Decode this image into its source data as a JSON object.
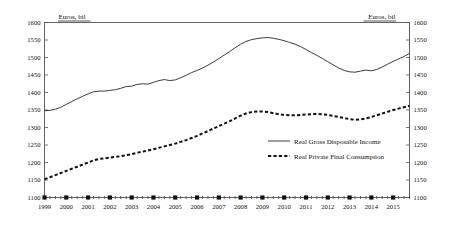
{
  "chart_data": {
    "type": "line",
    "title": "",
    "subtitle": "",
    "unit_label_left": "Euros, bil",
    "unit_label_right": "Euros, bil",
    "xlabel": "",
    "ylabel": "",
    "ylim": [
      1100,
      1600
    ],
    "ytick_step": 50,
    "yticks": [
      1100,
      1150,
      1200,
      1250,
      1300,
      1350,
      1400,
      1450,
      1500,
      1550,
      1600
    ],
    "ytick_labels": [
      "1100",
      "1150",
      "1200",
      "1250",
      "1300",
      "1350",
      "1400",
      "1450",
      "1500",
      "1550",
      "1600"
    ],
    "xlim": [
      1999.0,
      2015.75
    ],
    "xtick_labels": [
      "1999",
      "2000",
      "2001",
      "2002",
      "2003",
      "2004",
      "2005",
      "2006",
      "2007",
      "2008",
      "2009",
      "2010",
      "2011",
      "2012",
      "2013",
      "2014",
      "2015"
    ],
    "x_minor_per_year": 4,
    "grid": false,
    "legend_position": "center-right",
    "axes": {
      "left": true,
      "right": true,
      "top": true,
      "bottom": true
    },
    "x": [
      1999.0,
      1999.25,
      1999.5,
      1999.75,
      2000.0,
      2000.25,
      2000.5,
      2000.75,
      2001.0,
      2001.25,
      2001.5,
      2001.75,
      2002.0,
      2002.25,
      2002.5,
      2002.75,
      2003.0,
      2003.25,
      2003.5,
      2003.75,
      2004.0,
      2004.25,
      2004.5,
      2004.75,
      2005.0,
      2005.25,
      2005.5,
      2005.75,
      2006.0,
      2006.25,
      2006.5,
      2006.75,
      2007.0,
      2007.25,
      2007.5,
      2007.75,
      2008.0,
      2008.25,
      2008.5,
      2008.75,
      2009.0,
      2009.25,
      2009.5,
      2009.75,
      2010.0,
      2010.25,
      2010.5,
      2010.75,
      2011.0,
      2011.25,
      2011.5,
      2011.75,
      2012.0,
      2012.25,
      2012.5,
      2012.75,
      2013.0,
      2013.25,
      2013.5,
      2013.75,
      2014.0,
      2014.25,
      2014.5,
      2014.75,
      2015.0,
      2015.25,
      2015.5,
      2015.75
    ],
    "series": [
      {
        "name": "Real Gross Disposable Income",
        "style": "solid",
        "color": "#333333",
        "values": [
          1348,
          1349,
          1352,
          1358,
          1366,
          1374,
          1382,
          1389,
          1396,
          1402,
          1404,
          1404,
          1406,
          1408,
          1412,
          1417,
          1418,
          1423,
          1425,
          1424,
          1429,
          1434,
          1437,
          1434,
          1436,
          1442,
          1449,
          1457,
          1463,
          1470,
          1478,
          1487,
          1497,
          1507,
          1517,
          1528,
          1538,
          1546,
          1551,
          1554,
          1556,
          1557,
          1555,
          1552,
          1548,
          1543,
          1538,
          1531,
          1523,
          1514,
          1506,
          1497,
          1488,
          1479,
          1470,
          1463,
          1459,
          1458,
          1461,
          1464,
          1462,
          1466,
          1473,
          1481,
          1489,
          1496,
          1503,
          1512
        ]
      },
      {
        "name": "Real Private Final Consumption",
        "style": "dashed",
        "color": "#111111",
        "values": [
          1152,
          1158,
          1164,
          1170,
          1176,
          1182,
          1188,
          1194,
          1200,
          1206,
          1210,
          1212,
          1214,
          1216,
          1218,
          1221,
          1224,
          1228,
          1231,
          1234,
          1238,
          1242,
          1246,
          1250,
          1254,
          1259,
          1264,
          1270,
          1276,
          1283,
          1290,
          1297,
          1304,
          1311,
          1318,
          1326,
          1334,
          1340,
          1344,
          1346,
          1346,
          1344,
          1341,
          1338,
          1336,
          1335,
          1335,
          1336,
          1337,
          1338,
          1339,
          1338,
          1336,
          1333,
          1330,
          1327,
          1324,
          1322,
          1323,
          1326,
          1330,
          1335,
          1340,
          1345,
          1350,
          1354,
          1358,
          1362
        ]
      }
    ]
  }
}
